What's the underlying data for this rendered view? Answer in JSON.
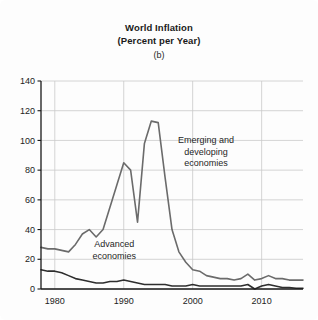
{
  "figure": {
    "title_lines": [
      "World  Inflation",
      "(Percent per Year)"
    ],
    "panel_label": "(b)",
    "background_color": "#fdfdfd"
  },
  "chart_data": {
    "type": "line",
    "title": "World  Inflation (Percent per Year)",
    "subtitle": "(b)",
    "xlabel": "",
    "ylabel": "",
    "xlim": [
      1978,
      2016
    ],
    "ylim": [
      0,
      140
    ],
    "yticks": [
      0,
      20,
      40,
      60,
      80,
      100,
      120,
      140
    ],
    "xticks": [
      1980,
      1990,
      2000,
      2010
    ],
    "ytick_labels": [
      "0",
      "20",
      "40",
      "60",
      "80",
      "100",
      "120",
      "140"
    ],
    "xtick_labels": [
      "1980",
      "1990",
      "2000",
      "2010"
    ],
    "grid": true,
    "grid_color": "#c9c9c9",
    "legend": "annotations",
    "x": [
      1978,
      1979,
      1980,
      1981,
      1982,
      1983,
      1984,
      1985,
      1986,
      1987,
      1988,
      1989,
      1990,
      1991,
      1992,
      1993,
      1994,
      1995,
      1996,
      1997,
      1998,
      1999,
      2000,
      2001,
      2002,
      2003,
      2004,
      2005,
      2006,
      2007,
      2008,
      2009,
      2010,
      2011,
      2012,
      2013,
      2014,
      2015,
      2016
    ],
    "series": [
      {
        "name": "Emerging and developing economies",
        "color": "#6b6b6b",
        "width": 1.6,
        "values": [
          28,
          27,
          27,
          26,
          25,
          30,
          37,
          40,
          35,
          40,
          55,
          70,
          85,
          80,
          45,
          98,
          113,
          112,
          75,
          40,
          25,
          18,
          13,
          12,
          9,
          8,
          7,
          7,
          6,
          7,
          10,
          6,
          7,
          9,
          7,
          7,
          6,
          6,
          6
        ]
      },
      {
        "name": "Advanced economies",
        "color": "#2e2e2e",
        "width": 1.6,
        "values": [
          13,
          12,
          12,
          11,
          9,
          7,
          6,
          5,
          4,
          4,
          5,
          5,
          6,
          5,
          4,
          3,
          3,
          3,
          3,
          2,
          2,
          2,
          3,
          2,
          2,
          2,
          2,
          2,
          2,
          2,
          3,
          0,
          2,
          3,
          2,
          1,
          1,
          0.5,
          0.5
        ]
      }
    ],
    "annotations": [
      {
        "id": "emerging-label",
        "text_lines": [
          "Emerging and",
          "developing",
          "economies"
        ],
        "x_pct": 63,
        "y_pct": 30
      },
      {
        "id": "advanced-label",
        "text_lines": [
          "Advanced",
          "economies"
        ],
        "x_pct": 28,
        "y_pct": 80
      }
    ]
  }
}
